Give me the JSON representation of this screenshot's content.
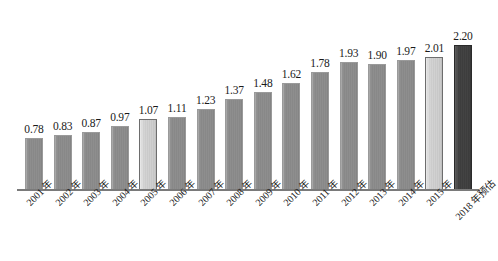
{
  "chart_data": {
    "type": "bar",
    "title": "",
    "subtitle": "",
    "xlabel": "",
    "ylabel": "",
    "ylim": [
      0,
      2.45
    ],
    "grid": false,
    "legend": "none",
    "categories": [
      "2001 年",
      "2002 年",
      "2003 年",
      "2004 年",
      "2005 年",
      "2006 年",
      "2007 年",
      "2008 年",
      "2009 年",
      "2010 年",
      "2011 年",
      "2012 年",
      "2013 年",
      "2014 年",
      "2015 年",
      "2018 年预估"
    ],
    "values": [
      0.78,
      0.83,
      0.87,
      0.97,
      1.07,
      1.11,
      1.23,
      1.37,
      1.48,
      1.62,
      1.78,
      1.93,
      1.9,
      1.97,
      2.01,
      2.2
    ],
    "value_labels": [
      "0.78",
      "0.83",
      "0.87",
      "0.97",
      "1.07",
      "1.11",
      "1.23",
      "1.37",
      "1.48",
      "1.62",
      "1.78",
      "1.93",
      "1.90",
      "1.97",
      "2.01",
      "2.20"
    ],
    "bar_styles": [
      "normal",
      "normal",
      "normal",
      "normal",
      "light",
      "normal",
      "normal",
      "normal",
      "normal",
      "normal",
      "normal",
      "normal",
      "normal",
      "normal",
      "light",
      "dark"
    ],
    "colors": {
      "bar_normal": "#8a8a8a",
      "bar_light": "#cacaca",
      "bar_dark": "#3f3f3f",
      "axis_line": "#7a7a7a",
      "label_text": "#1a1a1a",
      "background": "#ffffff"
    }
  }
}
